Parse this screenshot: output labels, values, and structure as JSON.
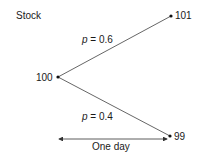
{
  "title": "Stock",
  "nodes": {
    "start": "100",
    "up": "101",
    "down": "99"
  },
  "branches": {
    "up": {
      "var": "p",
      "eq": " = ",
      "value": "0.6"
    },
    "down": {
      "var": "p",
      "eq": " = ",
      "value": "0.4"
    }
  },
  "time_label": "One day",
  "colors": {
    "line": "#555555",
    "text": "#1a1a1a"
  }
}
